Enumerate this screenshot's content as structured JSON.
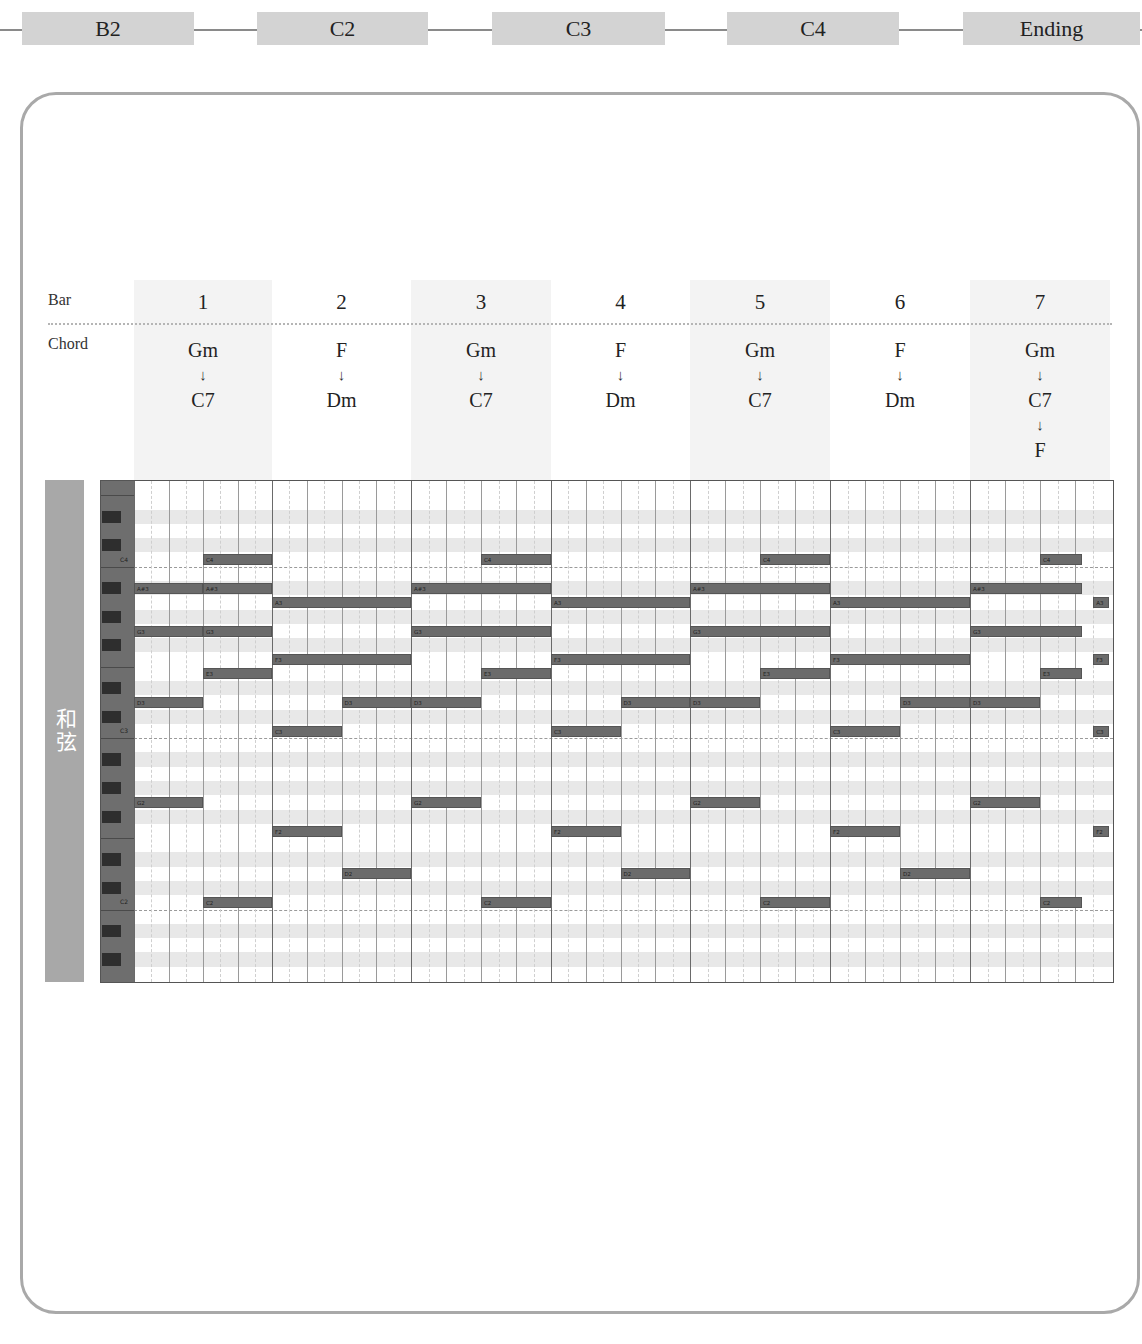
{
  "timeline": {
    "sections": [
      {
        "label": "B2",
        "x": 22,
        "w": 172
      },
      {
        "label": "C2",
        "x": 257,
        "w": 171
      },
      {
        "label": "C3",
        "x": 492,
        "w": 173
      },
      {
        "label": "C4",
        "x": 727,
        "w": 172
      },
      {
        "label": "Ending",
        "x": 963,
        "w": 177
      }
    ]
  },
  "header": {
    "bar_label": "Bar",
    "chord_label": "Chord",
    "bars": [
      {
        "num": "1",
        "chords": [
          "Gm",
          "C7"
        ],
        "shaded": true
      },
      {
        "num": "2",
        "chords": [
          "F",
          "Dm"
        ],
        "shaded": false
      },
      {
        "num": "3",
        "chords": [
          "Gm",
          "C7"
        ],
        "shaded": true
      },
      {
        "num": "4",
        "chords": [
          "F",
          "Dm"
        ],
        "shaded": false
      },
      {
        "num": "5",
        "chords": [
          "Gm",
          "C7"
        ],
        "shaded": true
      },
      {
        "num": "6",
        "chords": [
          "F",
          "Dm"
        ],
        "shaded": false
      },
      {
        "num": "7",
        "chords": [
          "Gm",
          "C7",
          "F"
        ],
        "shaded": true
      }
    ],
    "arrow": "↓"
  },
  "side_tag": {
    "label": "和弦"
  },
  "piano_roll": {
    "top_pitch": "F4",
    "rows": 35,
    "key_labels": [
      "C4",
      "C3",
      "C2"
    ],
    "notes": [
      {
        "pitch": "A#3",
        "start": 0,
        "end": 1,
        "label": "A#3"
      },
      {
        "pitch": "G3",
        "start": 0,
        "end": 1,
        "label": "G3"
      },
      {
        "pitch": "D3",
        "start": 0,
        "end": 1,
        "label": "D3"
      },
      {
        "pitch": "G2",
        "start": 0,
        "end": 1,
        "label": "G2"
      },
      {
        "pitch": "C4",
        "start": 1,
        "end": 2,
        "label": "C4"
      },
      {
        "pitch": "A#3",
        "start": 1,
        "end": 2,
        "label": "A#3"
      },
      {
        "pitch": "G3",
        "start": 1,
        "end": 2,
        "label": "G3"
      },
      {
        "pitch": "E3",
        "start": 1,
        "end": 2,
        "label": "E3"
      },
      {
        "pitch": "C2",
        "start": 1,
        "end": 2,
        "label": "C2"
      },
      {
        "pitch": "A3",
        "start": 2,
        "end": 4,
        "label": "A3"
      },
      {
        "pitch": "F3",
        "start": 2,
        "end": 4,
        "label": "F3"
      },
      {
        "pitch": "C3",
        "start": 2,
        "end": 3,
        "label": "C3"
      },
      {
        "pitch": "F2",
        "start": 2,
        "end": 3,
        "label": "F2"
      },
      {
        "pitch": "D3",
        "start": 3,
        "end": 4,
        "label": "D3"
      },
      {
        "pitch": "D2",
        "start": 3,
        "end": 4,
        "label": "D2"
      },
      {
        "pitch": "A#3",
        "start": 4,
        "end": 6,
        "label": "A#3"
      },
      {
        "pitch": "G3",
        "start": 4,
        "end": 6,
        "label": "G3"
      },
      {
        "pitch": "D3",
        "start": 4,
        "end": 5,
        "label": "D3"
      },
      {
        "pitch": "G2",
        "start": 4,
        "end": 5,
        "label": "G2"
      },
      {
        "pitch": "C4",
        "start": 5,
        "end": 6,
        "label": "C4"
      },
      {
        "pitch": "E3",
        "start": 5,
        "end": 6,
        "label": "E3"
      },
      {
        "pitch": "C2",
        "start": 5,
        "end": 6,
        "label": "C2"
      },
      {
        "pitch": "A3",
        "start": 6,
        "end": 8,
        "label": "A3"
      },
      {
        "pitch": "F3",
        "start": 6,
        "end": 8,
        "label": "F3"
      },
      {
        "pitch": "C3",
        "start": 6,
        "end": 7,
        "label": "C3"
      },
      {
        "pitch": "F2",
        "start": 6,
        "end": 7,
        "label": "F2"
      },
      {
        "pitch": "D3",
        "start": 7,
        "end": 8,
        "label": "D3"
      },
      {
        "pitch": "D2",
        "start": 7,
        "end": 8,
        "label": "D2"
      },
      {
        "pitch": "A#3",
        "start": 8,
        "end": 10,
        "label": "A#3"
      },
      {
        "pitch": "G3",
        "start": 8,
        "end": 10,
        "label": "G3"
      },
      {
        "pitch": "D3",
        "start": 8,
        "end": 9,
        "label": "D3"
      },
      {
        "pitch": "G2",
        "start": 8,
        "end": 9,
        "label": "G2"
      },
      {
        "pitch": "C4",
        "start": 9,
        "end": 10,
        "label": "C4"
      },
      {
        "pitch": "E3",
        "start": 9,
        "end": 10,
        "label": "E3"
      },
      {
        "pitch": "C2",
        "start": 9,
        "end": 10,
        "label": "C2"
      },
      {
        "pitch": "A3",
        "start": 10,
        "end": 12,
        "label": "A3"
      },
      {
        "pitch": "F3",
        "start": 10,
        "end": 12,
        "label": "F3"
      },
      {
        "pitch": "C3",
        "start": 10,
        "end": 11,
        "label": "C3"
      },
      {
        "pitch": "F2",
        "start": 10,
        "end": 11,
        "label": "F2"
      },
      {
        "pitch": "D3",
        "start": 11,
        "end": 12,
        "label": "D3"
      },
      {
        "pitch": "D2",
        "start": 11,
        "end": 12,
        "label": "D2"
      },
      {
        "pitch": "A#3",
        "start": 12,
        "end": 13.6,
        "label": "A#3"
      },
      {
        "pitch": "G3",
        "start": 12,
        "end": 13.6,
        "label": "G3"
      },
      {
        "pitch": "D3",
        "start": 12,
        "end": 13,
        "label": "D3"
      },
      {
        "pitch": "G2",
        "start": 12,
        "end": 13,
        "label": "G2"
      },
      {
        "pitch": "C4",
        "start": 13,
        "end": 13.6,
        "label": "C4"
      },
      {
        "pitch": "E3",
        "start": 13,
        "end": 13.6,
        "label": "E3"
      },
      {
        "pitch": "C2",
        "start": 13,
        "end": 13.6,
        "label": "C2"
      },
      {
        "pitch": "A3",
        "start": 13.76,
        "end": 13.98,
        "label": "A3"
      },
      {
        "pitch": "F3",
        "start": 13.76,
        "end": 13.98,
        "label": "F3"
      },
      {
        "pitch": "C3",
        "start": 13.76,
        "end": 13.98,
        "label": "C3"
      },
      {
        "pitch": "F2",
        "start": 13.76,
        "end": 13.98,
        "label": "F2"
      }
    ]
  }
}
